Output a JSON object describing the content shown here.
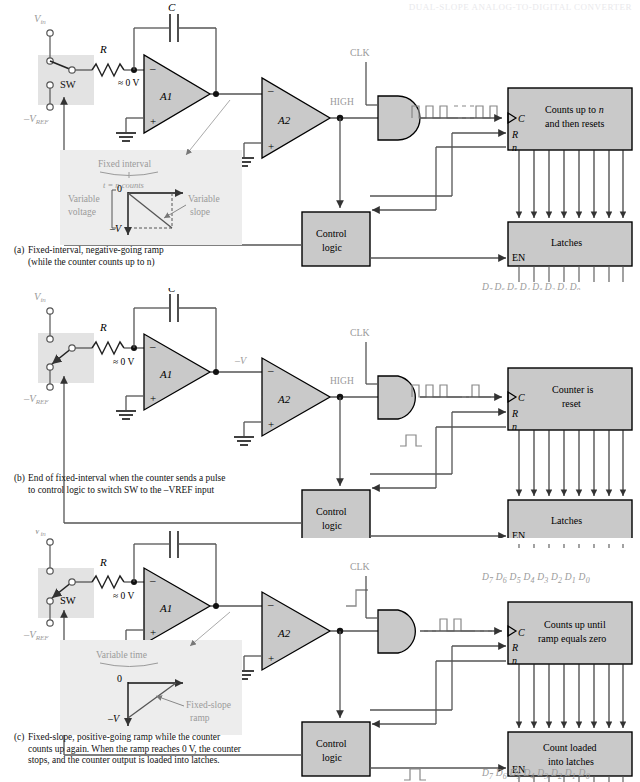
{
  "header": {
    "running_head": "DUAL-SLOPE ANALOG-TO-DIGITAL CONVERTER"
  },
  "common": {
    "vin": "V",
    "vin_sub": "in",
    "vref": "–V",
    "vref_sub": "REF",
    "sw": "SW",
    "r": "R",
    "c": "C",
    "zero_v": "≈ 0 V",
    "a1": "A1",
    "a2": "A2",
    "clk": "CLK",
    "high": "HIGH",
    "control_logic_line1": "Control",
    "control_logic_line2": "logic",
    "latches": "Latches",
    "en": "EN",
    "c_in": "C",
    "r_in": "R",
    "n_in": "n",
    "data_labels": [
      "D7",
      "D6",
      "D5",
      "D4",
      "D3",
      "D2",
      "D1",
      "D0"
    ],
    "data_bits": [
      "7",
      "6",
      "5",
      "4",
      "3",
      "2",
      "1",
      "0"
    ],
    "neg_v": "–V",
    "zero": "0"
  },
  "panels": [
    {
      "id": "a",
      "counter_line1": "Counts up to n",
      "counter_line2": "and then resets",
      "latch_label": "Latches",
      "switch_position": "up",
      "ramp_label": "",
      "inset": {
        "present": true,
        "top_label": "Fixed interval",
        "sub_label": "t = n counts",
        "left_label_line1": "Variable",
        "left_label_line2": "voltage",
        "right_label_line1": "Variable",
        "right_label_line2": "slope",
        "axis_zero": "0",
        "axis_neg": "–V",
        "direction": "negative-going"
      },
      "caption_line1": "Fixed-interval, negative-going ramp",
      "caption_line2": "(while the counter counts up to n)",
      "caption_prefix": "(a)",
      "pulse_train": "full",
      "control_pulse": false
    },
    {
      "id": "b",
      "counter_line1": "Counter is",
      "counter_line2": "reset",
      "latch_label": "Latches",
      "switch_position": "down",
      "ramp_label": "–V",
      "inset": {
        "present": false
      },
      "caption_line1": "End of fixed-interval when the counter sends a pulse",
      "caption_line2": "to control logic to switch SW to the –VREF input",
      "caption_prefix": "(b)",
      "pulse_train": "ending",
      "control_pulse": true
    },
    {
      "id": "c",
      "counter_line1": "Counts up until",
      "counter_line2": "ramp equals zero",
      "latch_label_line1": "Count loaded",
      "latch_label_line2": "into latches",
      "switch_position": "down",
      "ramp_label": "",
      "inset": {
        "present": true,
        "top_label": "Variable time",
        "sub_label": "",
        "left_label_line1": "",
        "left_label_line2": "",
        "right_label_line1": "Fixed-slope",
        "right_label_line2": "ramp",
        "axis_zero": "0",
        "axis_neg": "–V",
        "direction": "positive-going"
      },
      "caption_line1": "Fixed-slope, positive-going ramp while the counter",
      "caption_line2": "counts up again. When the ramp reaches 0 V, the counter",
      "caption_line3": "stops, and the counter output is loaded into latches.",
      "caption_prefix": "(c)",
      "pulse_train": "starting",
      "control_pulse": true
    }
  ],
  "colors": {
    "block_fill": "#c9c9c9",
    "block_stroke": "#000000",
    "wire": "#555555",
    "wire_dark": "#222222",
    "inset_fill": "#ededed",
    "switch_box_fill": "#e3e3e3",
    "faint_text": "#9a9a9a"
  }
}
